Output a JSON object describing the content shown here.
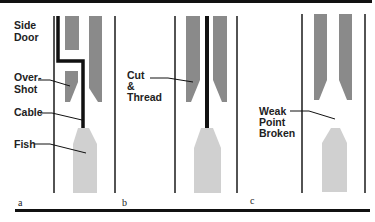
{
  "figure": {
    "panels": [
      {
        "letter": "a",
        "labels": {
          "side_door": [
            "Side",
            "Door"
          ],
          "overshot": [
            "Over-",
            "Shot"
          ],
          "cable": "Cable",
          "fish": "Fish"
        }
      },
      {
        "letter": "b",
        "labels": {
          "cut_thread": [
            "Cut",
            "&",
            "Thread"
          ]
        }
      },
      {
        "letter": "c",
        "labels": {
          "weak_point": [
            "Weak",
            "Point",
            "Broken"
          ]
        }
      }
    ],
    "colors": {
      "wall": "#1a1a1a",
      "tool": "#8a8a8a",
      "fish": "#d0d0d0",
      "cable": "#111111",
      "border": "#111111"
    }
  }
}
